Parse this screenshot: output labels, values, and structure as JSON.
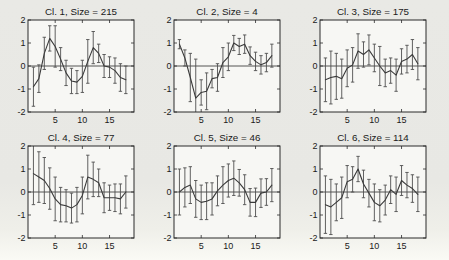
{
  "figure": {
    "kind": "matlab-style small-multiples of cluster mean profiles with error bars",
    "rows": 2,
    "cols": 3
  },
  "colors": {
    "page_bg": "#e8e8e4",
    "plot_bg": "#f7f7f4",
    "frame": "#2b2b2b",
    "line": "#3a3a3a",
    "error_bar": "#4f4f4f",
    "text": "#1a1a1a"
  },
  "chart_data": [
    {
      "type": "line",
      "title": "Cl. 1, Size = 215",
      "cluster": 1,
      "size": 215,
      "x": [
        1,
        2,
        3,
        4,
        5,
        6,
        7,
        8,
        9,
        10,
        11,
        12,
        13,
        14,
        15,
        16,
        17,
        18
      ],
      "values": [
        -0.9,
        -0.55,
        0.55,
        1.2,
        0.85,
        0.3,
        -0.3,
        -0.65,
        -0.7,
        -0.45,
        0.2,
        0.8,
        0.55,
        0.0,
        -0.05,
        -0.2,
        -0.5,
        -0.6
      ],
      "errors": [
        0.85,
        0.6,
        0.7,
        0.55,
        0.9,
        0.5,
        0.55,
        0.55,
        0.5,
        0.7,
        0.95,
        0.7,
        0.4,
        0.5,
        0.45,
        0.55,
        0.6,
        0.6
      ],
      "xlim": [
        0,
        19.5
      ],
      "ylim": [
        -2,
        2
      ],
      "xticks": [
        5,
        10,
        15
      ],
      "xtick_labels": [
        "5",
        "10",
        "15"
      ],
      "yticks": [
        -2,
        -1,
        0,
        1,
        2
      ],
      "ytick_labels": [
        "-2",
        "-1",
        "0",
        "1",
        "2"
      ],
      "zero_line": true,
      "error_bars": true,
      "grid": false,
      "legend": null,
      "xlabel": "",
      "ylabel": ""
    },
    {
      "type": "line",
      "title": "Cl. 2, Size = 4",
      "cluster": 2,
      "size": 4,
      "x": [
        1,
        2,
        3,
        4,
        5,
        6,
        7,
        8,
        9,
        10,
        11,
        12,
        13,
        14,
        15,
        16,
        17,
        18
      ],
      "values": [
        0.95,
        0.35,
        -0.5,
        -1.4,
        -1.15,
        -1.1,
        -0.55,
        -0.5,
        0.15,
        0.4,
        1.0,
        0.85,
        0.95,
        0.45,
        0.2,
        0.05,
        0.15,
        0.45
      ],
      "errors": [
        0.2,
        0.35,
        1.05,
        1.7,
        0.55,
        0.8,
        0.4,
        0.6,
        0.65,
        0.6,
        0.33,
        0.35,
        0.4,
        0.38,
        0.4,
        0.4,
        0.4,
        0.5
      ],
      "xlim": [
        0,
        19.5
      ],
      "ylim": [
        -2,
        2
      ],
      "xticks": [
        5,
        10,
        15
      ],
      "xtick_labels": [
        "5",
        "10",
        "15"
      ],
      "yticks": [
        -2,
        -1,
        0,
        1,
        2
      ],
      "ytick_labels": [
        "-2",
        "-1",
        "0",
        "1",
        "2"
      ],
      "zero_line": true,
      "error_bars": true,
      "grid": false,
      "legend": null,
      "xlabel": "",
      "ylabel": ""
    },
    {
      "type": "line",
      "title": "Cl. 3, Size = 175",
      "cluster": 3,
      "size": 175,
      "x": [
        1,
        2,
        3,
        4,
        5,
        6,
        7,
        8,
        9,
        10,
        11,
        12,
        13,
        14,
        15,
        16,
        17,
        18
      ],
      "values": [
        -0.6,
        -0.5,
        -0.45,
        -0.55,
        -0.1,
        0.05,
        0.65,
        0.5,
        0.7,
        0.35,
        0.0,
        -0.3,
        -0.2,
        -0.4,
        0.2,
        0.3,
        0.5,
        0.1
      ],
      "errors": [
        0.95,
        1.15,
        1.0,
        0.85,
        0.8,
        0.75,
        0.75,
        0.55,
        0.65,
        0.6,
        0.85,
        0.6,
        0.55,
        0.7,
        0.55,
        0.6,
        0.65,
        0.7
      ],
      "xlim": [
        0,
        19.5
      ],
      "ylim": [
        -2,
        2
      ],
      "xticks": [
        5,
        10,
        15
      ],
      "xtick_labels": [
        "5",
        "10",
        "15"
      ],
      "yticks": [
        -2,
        -1,
        0,
        1,
        2
      ],
      "ytick_labels": [
        "-2",
        "-1",
        "0",
        "1",
        "2"
      ],
      "zero_line": true,
      "error_bars": true,
      "grid": false,
      "legend": null,
      "xlabel": "",
      "ylabel": ""
    },
    {
      "type": "line",
      "title": "Cl. 4, Size = 77",
      "cluster": 4,
      "size": 77,
      "x": [
        1,
        2,
        3,
        4,
        5,
        6,
        7,
        8,
        9,
        10,
        11,
        12,
        13,
        14,
        15,
        16,
        17,
        18
      ],
      "values": [
        0.8,
        0.65,
        0.5,
        0.15,
        -0.3,
        -0.55,
        -0.6,
        -0.7,
        -0.55,
        -0.15,
        0.65,
        0.55,
        0.4,
        -0.25,
        -0.25,
        -0.25,
        -0.3,
        0.0
      ],
      "errors": [
        1.35,
        1.1,
        1.0,
        0.9,
        0.95,
        0.75,
        0.7,
        0.65,
        0.75,
        0.8,
        0.95,
        0.75,
        0.6,
        0.65,
        0.55,
        0.6,
        0.65,
        0.7
      ],
      "xlim": [
        0,
        19.5
      ],
      "ylim": [
        -2,
        2
      ],
      "xticks": [
        5,
        10,
        15
      ],
      "xtick_labels": [
        "5",
        "10",
        "15"
      ],
      "yticks": [
        -2,
        -1,
        0,
        1,
        2
      ],
      "ytick_labels": [
        "-2",
        "-1",
        "0",
        "1",
        "2"
      ],
      "zero_line": true,
      "error_bars": true,
      "grid": false,
      "legend": null,
      "xlabel": "",
      "ylabel": ""
    },
    {
      "type": "line",
      "title": "Cl. 5, Size = 46",
      "cluster": 5,
      "size": 46,
      "x": [
        1,
        2,
        3,
        4,
        5,
        6,
        7,
        8,
        9,
        10,
        11,
        12,
        13,
        14,
        15,
        16,
        17,
        18
      ],
      "values": [
        0.0,
        0.2,
        0.3,
        -0.3,
        -0.45,
        -0.4,
        -0.3,
        0.05,
        0.3,
        0.5,
        0.6,
        0.4,
        0.1,
        -0.45,
        -0.45,
        -0.05,
        0.0,
        0.3
      ],
      "errors": [
        1.0,
        0.85,
        0.8,
        0.8,
        0.75,
        0.8,
        0.7,
        0.65,
        0.8,
        0.72,
        0.75,
        0.58,
        0.65,
        0.6,
        0.62,
        0.62,
        0.58,
        0.72
      ],
      "xlim": [
        0,
        19.5
      ],
      "ylim": [
        -2,
        2
      ],
      "xticks": [
        5,
        10,
        15
      ],
      "xtick_labels": [
        "5",
        "10",
        "15"
      ],
      "yticks": [
        -2,
        -1,
        0,
        1,
        2
      ],
      "ytick_labels": [
        "-2",
        "-1",
        "0",
        "1",
        "2"
      ],
      "zero_line": true,
      "error_bars": true,
      "grid": false,
      "legend": null,
      "xlabel": "",
      "ylabel": ""
    },
    {
      "type": "line",
      "title": "Cl. 6, Size = 114",
      "cluster": 6,
      "size": 114,
      "x": [
        1,
        2,
        3,
        4,
        5,
        6,
        7,
        8,
        9,
        10,
        11,
        12,
        13,
        14,
        15,
        16,
        17,
        18
      ],
      "values": [
        -0.55,
        -0.65,
        -0.45,
        -0.25,
        0.45,
        0.55,
        1.0,
        0.35,
        -0.05,
        -0.45,
        -0.6,
        -0.35,
        0.1,
        -0.1,
        0.5,
        0.3,
        0.15,
        -0.1
      ],
      "errors": [
        1.25,
        1.2,
        0.8,
        0.9,
        0.7,
        0.55,
        0.55,
        0.6,
        0.6,
        0.8,
        0.7,
        0.65,
        0.6,
        0.75,
        0.65,
        0.55,
        0.6,
        0.75
      ],
      "xlim": [
        0,
        19.5
      ],
      "ylim": [
        -2,
        2
      ],
      "xticks": [
        5,
        10,
        15
      ],
      "xtick_labels": [
        "5",
        "10",
        "15"
      ],
      "yticks": [
        -2,
        -1,
        0,
        1,
        2
      ],
      "ytick_labels": [
        "-2",
        "-1",
        "0",
        "1",
        "2"
      ],
      "zero_line": true,
      "error_bars": true,
      "grid": false,
      "legend": null,
      "xlabel": "",
      "ylabel": ""
    }
  ]
}
